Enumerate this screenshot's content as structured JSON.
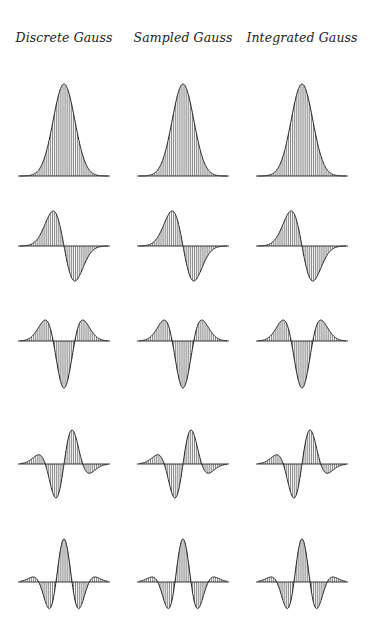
{
  "columns": [
    {
      "title": "Discrete Gauss",
      "center_x": 64
    },
    {
      "title": "Sampled Gauss",
      "center_x": 183
    },
    {
      "title": "Integrated Gauss",
      "center_x": 302
    }
  ],
  "chart_data": {
    "type": "stem",
    "grid": false,
    "sigma_samples": 3.2,
    "half_width_samples": 13,
    "rows": [
      {
        "order": 0,
        "baseline_y": 176,
        "max_abs_px": 92
      },
      {
        "order": 1,
        "baseline_y": 246,
        "max_abs_px": 35
      },
      {
        "order": 2,
        "baseline_y": 341,
        "max_abs_px": 47
      },
      {
        "order": 3,
        "baseline_y": 464,
        "max_abs_px": 34
      },
      {
        "order": 4,
        "baseline_y": 582,
        "max_abs_px": 43
      }
    ],
    "half_width_px": 44,
    "color": "#222222"
  }
}
